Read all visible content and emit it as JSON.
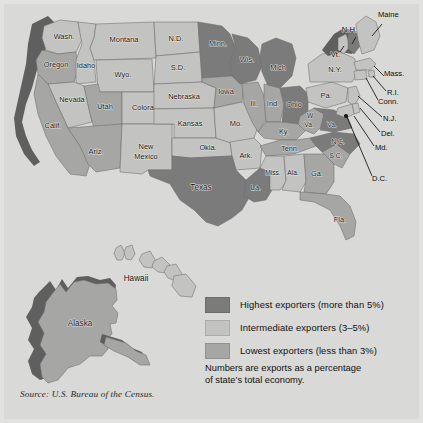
{
  "figure": {
    "background_color": "#d9d9d7",
    "source_note": "Source: U.S. Bureau of the Census."
  },
  "palette": {
    "highest": "#7b7b7b",
    "intermediate": "#c3c3c1",
    "lowest": "#a6a6a4",
    "shadow": "#5f5f5f",
    "ocean": "#d9d9d7",
    "border": "#6d6d6d"
  },
  "legend": {
    "items": [
      {
        "swatch": "#7b7b7b",
        "label": "Highest exporters (more than 5%)",
        "category": "highest"
      },
      {
        "swatch": "#c3c3c1",
        "label": "Intermediate exporters (3–5%)",
        "category": "intermediate"
      },
      {
        "swatch": "#a6a6a4",
        "label": "Lowest exporters (less than 3%)",
        "category": "lowest"
      }
    ],
    "note_line_1": "Numbers are exports as a percentage",
    "note_line_2": "of state’s total economy."
  },
  "map": {
    "labels": {
      "wash": "Wash.",
      "oregon": "Oregon",
      "idaho": "Idaho",
      "montana": "Montana",
      "nd": "N.D.",
      "sd": "S.D.",
      "minn": "Minn.",
      "wis": "Wis.",
      "mich": "Mich",
      "wyo": "Wyo.",
      "nebraska": "Nebraska",
      "iowa": "Iowa",
      "ill": "Ill.",
      "ind": "Ind.",
      "ohio": "Ohio",
      "nevada": "Nevada",
      "utah": "Utah",
      "colorado": "Colorado",
      "kansas": "Kansas",
      "mo": "Mo.",
      "ky": "Ky.",
      "calif": "Calif.",
      "ariz": "Ariz.",
      "newmexico_1": "New",
      "newmexico_2": "Mexico",
      "okla": "Okla.",
      "ark": "Ark.",
      "tenn": "Tenn.",
      "texas": "Texas",
      "la": "La.",
      "miss": "Miss.",
      "ala": "Ala.",
      "ga": "Ga.",
      "fla": "Fla.",
      "sc": "S.C.",
      "nc": "N.C.",
      "wva_1": "W",
      "wva_2": "Va.",
      "va": "Va.",
      "pa": "Pa.",
      "ny": "N.Y.",
      "vt": "Vt.",
      "nh": "N.H.",
      "maine": "Maine",
      "mass": "Mass.",
      "ri": "R.I.",
      "conn": "Conn.",
      "nj": "N.J.",
      "del": "Del.",
      "md": "Md.",
      "dc": "D.C.",
      "alaska": "Alaska",
      "hawaii": "Hawaii"
    },
    "categories": {
      "wash": "intermediate",
      "oregon": "lowest",
      "idaho": "intermediate",
      "montana": "intermediate",
      "nd": "intermediate",
      "sd": "intermediate",
      "minn": "highest",
      "wis": "highest",
      "mich": "highest",
      "wyo": "intermediate",
      "nebraska": "intermediate",
      "iowa": "lowest",
      "ill": "lowest",
      "ind": "lowest",
      "ohio": "highest",
      "nevada": "intermediate",
      "utah": "lowest",
      "colorado": "intermediate",
      "kansas": "intermediate",
      "mo": "intermediate",
      "ky": "lowest",
      "calif": "lowest",
      "ariz": "lowest",
      "newmexico": "intermediate",
      "okla": "intermediate",
      "ark": "intermediate",
      "tenn": "lowest",
      "texas": "highest",
      "la": "highest",
      "miss": "intermediate",
      "ala": "intermediate",
      "ga": "lowest",
      "fla": "lowest",
      "sc": "lowest",
      "nc": "highest",
      "wva": "lowest",
      "va": "highest",
      "pa": "intermediate",
      "ny": "intermediate",
      "vt": "intermediate",
      "nh": "highest",
      "maine": "intermediate",
      "mass": "intermediate",
      "ri": "intermediate",
      "conn": "intermediate",
      "nj": "intermediate",
      "del": "intermediate",
      "md": "intermediate",
      "dc": "highest",
      "alaska": "lowest",
      "hawaii": "intermediate"
    }
  }
}
